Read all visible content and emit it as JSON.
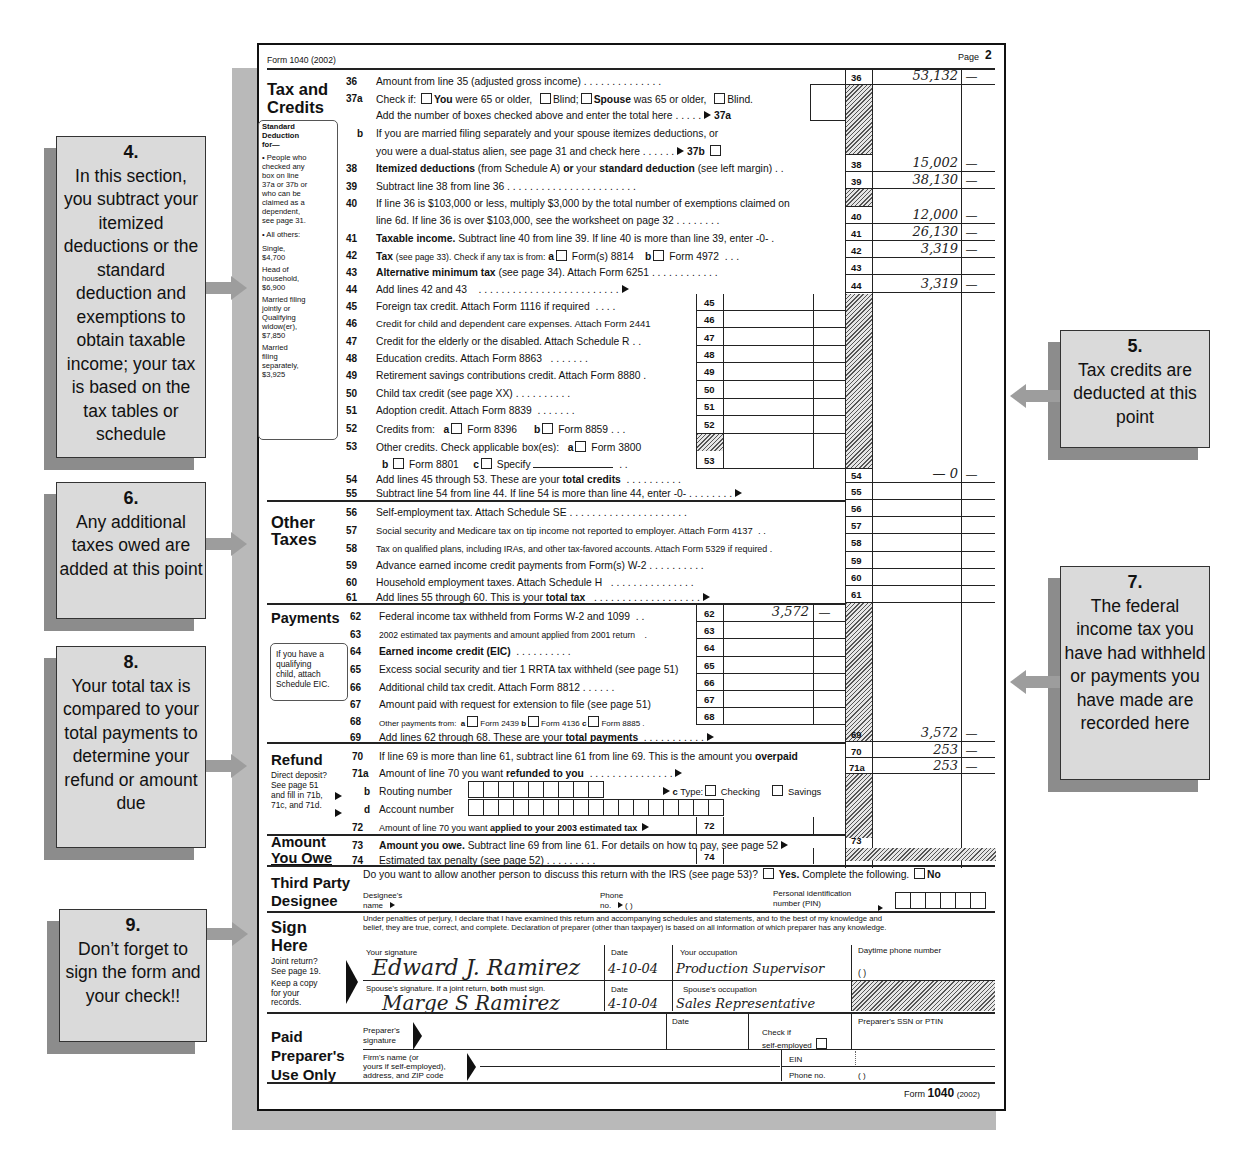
{
  "form": {
    "header_left": "Form 1040 (2002)",
    "page_label": "Page",
    "page_number": "2",
    "footer_form": "Form",
    "footer_num": "1040",
    "footer_year": "(2002)"
  },
  "sections": {
    "tax_credits": {
      "title_1": "Tax and",
      "title_2": "Credits"
    },
    "other_taxes": {
      "title_1": "Other",
      "title_2": "Taxes"
    },
    "payments": {
      "title": "Payments"
    },
    "refund": {
      "title": "Refund"
    },
    "amount_owe": {
      "title_1": "Amount",
      "title_2": "You Owe"
    },
    "third_party": {
      "title_1": "Third Party",
      "title_2": "Designee"
    },
    "sign": {
      "title_1": "Sign",
      "title_2": "Here"
    },
    "preparer": {
      "title_1": "Paid",
      "title_2": "Preparer's",
      "title_3": "Use Only"
    }
  },
  "std_deduction_box": {
    "lines": [
      "Standard",
      "Deduction",
      "for—",
      "• People who",
      "checked any",
      "box on line",
      "37a or 37b or",
      "who can be",
      "claimed as a",
      "dependent,",
      "see page 31.",
      "• All others:",
      "Single,",
      "$4,700",
      "Head of",
      "household,",
      "$6,900",
      "Married filing",
      "jointly or",
      "Qualifying",
      "widow(er),",
      "$7,850",
      "Married",
      "filing",
      "separately,",
      "$3,925"
    ]
  },
  "eic_box": {
    "lines": [
      "If you have a",
      "qualifying",
      "child, attach",
      "Schedule EIC."
    ]
  },
  "refund_note": {
    "lines": [
      "Direct deposit?",
      "See page 51",
      "and fill in 71b,",
      "71c, and 71d."
    ]
  },
  "sign_note": {
    "lines": [
      "Joint return?",
      "See page 19.",
      "Keep a copy",
      "for your",
      "records."
    ]
  },
  "lines": {
    "l36": {
      "num": "36",
      "text": "Amount from line 35 (adjusted gross income)",
      "amount": "53,132",
      "cents": "—"
    },
    "l37a": {
      "num": "37a",
      "check_if": "Check if:",
      "you": "You",
      "you_rest": "were 65 or older,",
      "blind": "Blind;",
      "spouse": "Spouse",
      "spouse_rest": "was 65 or older,",
      "blind2": "Blind.",
      "add": "Add the number of boxes checked above and enter the total here",
      "ref": "37a"
    },
    "l37b": {
      "num": "b",
      "text1": "If you are married filing separately and your spouse itemizes deductions, or",
      "text2": "you were a dual-status alien, see page 31 and check here",
      "ref": "37b"
    },
    "l38": {
      "num": "38",
      "b1": "Itemized deductions",
      "t1": "(from Schedule A)",
      "b2": "or",
      "t2": "your",
      "b3": "standard deduction",
      "t3": "(see left margin)",
      "amount": "15,002",
      "cents": "—"
    },
    "l39": {
      "num": "39",
      "text": "Subtract line 38 from line 36",
      "amount": "38,130",
      "cents": "—"
    },
    "l40": {
      "num": "40",
      "text1": "If line 36 is $103,000 or less, multiply $3,000 by the total number of exemptions claimed on",
      "text2": "line 6d. If line 36 is over $103,000, see the worksheet on page 32",
      "amount": "12,000",
      "cents": "—"
    },
    "l41": {
      "num": "41",
      "bold": "Taxable income.",
      "text": "Subtract line 40 from line 39. If line 40 is more than line 39, enter -0-",
      "amount": "26,130",
      "cents": "—"
    },
    "l42": {
      "num": "42",
      "bold": "Tax",
      "small": "(see page 33). Check if any tax is from:",
      "a": "a",
      "form_a": "Form(s) 8814",
      "b": "b",
      "form_b": "Form 4972",
      "amount": "3,319",
      "cents": "—"
    },
    "l43": {
      "num": "43",
      "bold": "Alternative minimum tax",
      "text": "(see page 34). Attach Form 6251"
    },
    "l44": {
      "num": "44",
      "text": "Add lines 42 and 43",
      "amount": "3,319",
      "cents": "—"
    },
    "l45": {
      "num": "45",
      "text": "Foreign tax credit. Attach Form 1116 if required"
    },
    "l46": {
      "num": "46",
      "text": "Credit for child and dependent care expenses. Attach Form 2441"
    },
    "l47": {
      "num": "47",
      "text": "Credit for the elderly or the disabled. Attach Schedule R"
    },
    "l48": {
      "num": "48",
      "text": "Education credits. Attach Form 8863"
    },
    "l49": {
      "num": "49",
      "text": "Retirement savings contributions credit. Attach Form 8880"
    },
    "l50": {
      "num": "50",
      "text": "Child tax credit (see page XX)"
    },
    "l51": {
      "num": "51",
      "text": "Adoption credit. Attach Form 8839"
    },
    "l52": {
      "num": "52",
      "text": "Credits from:",
      "a": "a",
      "form_a": "Form 8396",
      "b": "b",
      "form_b": "Form 8859"
    },
    "l53": {
      "num": "53",
      "text": "Other credits. Check applicable box(es):",
      "a": "a",
      "form_a": "Form 3800",
      "b": "b",
      "form_b": "Form 8801",
      "c": "c",
      "form_c": "Specify"
    },
    "l54": {
      "num": "54",
      "text": "Add lines 45 through 53. These are your",
      "bold": "total credits",
      "amount": "— 0",
      "cents": "—"
    },
    "l55": {
      "num": "55",
      "text": "Subtract line 54 from line 44. If line 54 is more than line 44, enter -0-"
    },
    "l56": {
      "num": "56",
      "text": "Self-employment tax. Attach Schedule SE"
    },
    "l57": {
      "num": "57",
      "text": "Social security and Medicare tax on tip income not reported to employer. Attach Form 4137"
    },
    "l58": {
      "num": "58",
      "text": "Tax on qualified plans, including IRAs, and other tax-favored accounts. Attach Form 5329 if required"
    },
    "l59": {
      "num": "59",
      "text": "Advance earned income credit payments from Form(s) W-2"
    },
    "l60": {
      "num": "60",
      "text": "Household employment taxes. Attach Schedule H"
    },
    "l61": {
      "num": "61",
      "text": "Add lines 55 through 60. This is your",
      "bold": "total tax"
    },
    "l62": {
      "num": "62",
      "text": "Federal income tax withheld from Forms W-2 and 1099",
      "amount": "3,572",
      "cents": "—"
    },
    "l63": {
      "num": "63",
      "text": "2002 estimated tax payments and amount applied from 2001 return"
    },
    "l64": {
      "num": "64",
      "bold": "Earned income credit (EIC)"
    },
    "l65": {
      "num": "65",
      "text": "Excess social security and tier 1 RRTA tax withheld (see page 51)"
    },
    "l66": {
      "num": "66",
      "text": "Additional child tax credit. Attach Form 8812"
    },
    "l67": {
      "num": "67",
      "text": "Amount paid with request for extension to file (see page 51)"
    },
    "l68": {
      "num": "68",
      "text": "Other payments from:",
      "a": "a",
      "form_a": "Form 2439",
      "b": "b",
      "form_b": "Form 4136",
      "c": "c",
      "form_c": "Form 8885"
    },
    "l69": {
      "num": "69",
      "text": "Add lines 62 through 68. These are your",
      "bold": "total payments",
      "amount": "3,572",
      "cents": "—"
    },
    "l70": {
      "num": "70",
      "text": "If line 69 is more than line 61, subtract line 61 from line 69. This is the amount you",
      "bold": "overpaid",
      "amount": "253",
      "cents": "—"
    },
    "l71a": {
      "num": "71a",
      "text": "Amount of line 70 you want",
      "bold": "refunded to you",
      "amount": "253",
      "cents": "—"
    },
    "l71b": {
      "num": "b",
      "text": "Routing number",
      "c_label": "c",
      "type": "Type:",
      "checking": "Checking",
      "savings": "Savings"
    },
    "l71d": {
      "num": "d",
      "text": "Account number"
    },
    "l72": {
      "num": "72",
      "text": "Amount of line 70 you want",
      "bold": "applied to your 2003 estimated tax"
    },
    "l73": {
      "num": "73",
      "bold": "Amount you owe.",
      "text": "Subtract line 69 from line 61. For details on how to pay, see page 52"
    },
    "l74": {
      "num": "74",
      "text": "Estimated tax penalty (see page 52)"
    }
  },
  "third_party": {
    "question": "Do you want to allow another person to discuss this return with the IRS (see page 53)?",
    "yes": "Yes.",
    "yes_rest": "Complete the following.",
    "no": "No",
    "designee_1": "Designee's",
    "designee_2": "name",
    "phone_1": "Phone",
    "phone_2": "no.",
    "phone_paren": "(        )",
    "pin_1": "Personal identification",
    "pin_2": "number (PIN)"
  },
  "sign": {
    "perjury_1": "Under penalties of perjury, I declare that I have examined this return and accompanying schedules and statements, and to the best of my knowledge and",
    "perjury_2": "belief, they are true, correct, and complete. Declaration of preparer (other than taxpayer) is based on all information of which preparer has any knowledge.",
    "your_sig_label": "Your signature",
    "your_sig": "Edward J. Ramirez",
    "date_label": "Date",
    "your_date": "4-10-04",
    "occupation_label": "Your occupation",
    "your_occupation": "Production Supervisor",
    "phone_label": "Daytime phone number",
    "phone_value": "(        )",
    "spouse_sig_label_1": "Spouse's signature. If a joint return,",
    "spouse_sig_bold": "both",
    "spouse_sig_label_2": "must sign.",
    "spouse_sig": "Marge S Ramirez",
    "spouse_date": "4-10-04",
    "spouse_occupation_label": "Spouse's occupation",
    "spouse_occupation": "Sales Representative"
  },
  "preparer": {
    "sig_1": "Preparer's",
    "sig_2": "signature",
    "date": "Date",
    "check_1": "Check if",
    "check_2": "self-employed",
    "ssn": "Preparer's SSN or PTIN",
    "firm_1": "Firm's name (or",
    "firm_2": "yours if self-employed),",
    "firm_3": "address, and ZIP code",
    "ein": "EIN",
    "phone": "Phone no.",
    "phone_paren": "(        )"
  },
  "callouts": [
    {
      "num": "4.",
      "text": "In this section, you subtract your itemized deductions  or the standard deduction and exemptions to obtain taxable income; your tax is based on the tax tables or schedule"
    },
    {
      "num": "5.",
      "text": "Tax credits are deducted at this point"
    },
    {
      "num": "6.",
      "text": "Any additional taxes owed are added at this point"
    },
    {
      "num": "7.",
      "text": "The federal income tax you have had withheld or payments you have made are recorded here"
    },
    {
      "num": "8.",
      "text": "Your total tax is compared to your total payments to determine your refund or amount due"
    },
    {
      "num": "9.",
      "text": "Don’t forget to sign the form and your check!!"
    }
  ]
}
